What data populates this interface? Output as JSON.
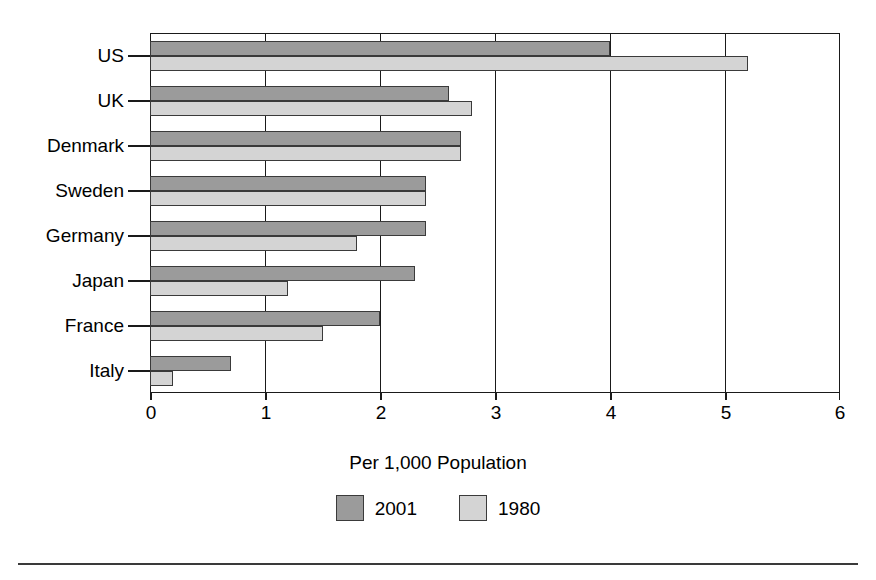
{
  "chart_data": {
    "type": "bar",
    "orientation": "horizontal",
    "title": "",
    "subtitle": "",
    "xlabel": "Per 1,000 Population",
    "ylabel": "",
    "xlim": [
      0,
      6
    ],
    "xticks": [
      "0",
      "1",
      "2",
      "3",
      "4",
      "5",
      "6"
    ],
    "grid": "vertical gridlines at each integer tick",
    "legend_position": "bottom-center",
    "categories": [
      "US",
      "UK",
      "Denmark",
      "Sweden",
      "Germany",
      "Japan",
      "France",
      "Italy"
    ],
    "series": [
      {
        "name": "2001",
        "color": "#9b9b9b",
        "values": [
          4.0,
          2.6,
          2.7,
          2.4,
          2.4,
          2.3,
          2.0,
          0.7
        ]
      },
      {
        "name": "1980",
        "color": "#d4d4d4",
        "values": [
          5.2,
          2.8,
          2.7,
          2.4,
          1.8,
          1.2,
          1.5,
          0.2
        ]
      }
    ]
  },
  "axis": {
    "x_title": "Per 1,000 Population",
    "x_tick_labels": [
      "0",
      "1",
      "2",
      "3",
      "4",
      "5",
      "6"
    ],
    "y_tick_labels": [
      "US",
      "UK",
      "Denmark",
      "Sweden",
      "Germany",
      "Japan",
      "France",
      "Italy"
    ]
  },
  "legend": {
    "entries": [
      {
        "label": "2001",
        "color": "#9b9b9b"
      },
      {
        "label": "1980",
        "color": "#d4d4d4"
      }
    ]
  },
  "colors": {
    "series_2001": "#9b9b9b",
    "series_1980": "#d4d4d4",
    "axis": "#1a1a1a",
    "background": "#ffffff"
  }
}
